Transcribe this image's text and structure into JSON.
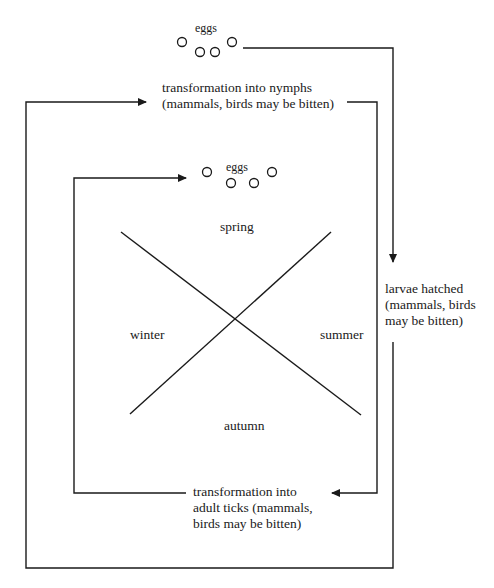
{
  "diagram": {
    "title": "",
    "colors": {
      "line": "#1a1a1a",
      "background": "#ffffff"
    },
    "nodes": {
      "eggs_top": {
        "label": "eggs"
      },
      "nymphs": {
        "lines": [
          "transformation into nymphs",
          "(mammals, birds may be bitten)"
        ]
      },
      "eggs_inner": {
        "label": "eggs"
      },
      "larvae": {
        "lines": [
          "larvae hatched",
          "(mammals, birds",
          "may be bitten)"
        ]
      },
      "adults": {
        "lines": [
          "transformation into",
          "adult ticks (mammals,",
          "birds may be bitten)"
        ]
      }
    },
    "seasons": {
      "spring": "spring",
      "summer": "summer",
      "autumn": "autumn",
      "winter": "winter"
    },
    "edges": [
      {
        "from": "eggs_top",
        "to": "larvae"
      },
      {
        "from": "larvae",
        "to": "adults"
      },
      {
        "from": "adults",
        "to": "eggs_inner"
      },
      {
        "from": "nymphs",
        "to": "adults"
      },
      {
        "from": "larvae",
        "to": "nymphs"
      }
    ]
  }
}
